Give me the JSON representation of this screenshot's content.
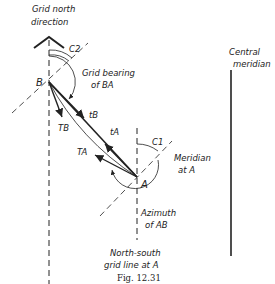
{
  "figure": {
    "caption": "Fig. 12.31",
    "labels": {
      "grid_north_line1": "Grid north",
      "grid_north_line2": "direction",
      "c2": "C2",
      "c1": "C1",
      "point_b": "B",
      "point_a": "A",
      "grid_bearing_line1": "Grid bearing",
      "grid_bearing_line2": "of BA",
      "t_b": "tB",
      "t_b_cap": "TB",
      "t_a": "tA",
      "t_a_cap": "TA",
      "meridian_line1": "Meridian",
      "meridian_line2": "at A",
      "azimuth_line1": "Azimuth",
      "azimuth_line2": "of AB",
      "ns_line1": "North-south",
      "ns_line2": "grid line at A",
      "central_line1": "Central",
      "central_line2": "meridian"
    },
    "colors": {
      "ink": "#222222",
      "background": "#ffffff"
    }
  }
}
